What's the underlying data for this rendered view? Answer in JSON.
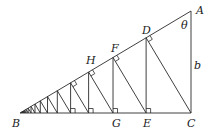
{
  "diagram": {
    "type": "geometric-construction",
    "vertices": {
      "A": [
        191,
        11
      ],
      "B": [
        20,
        113
      ],
      "C": [
        191,
        113
      ]
    },
    "labels": {
      "A": "A",
      "B": "B",
      "C": "C",
      "D": "D",
      "E": "E",
      "F": "F",
      "G": "G",
      "H": "H",
      "theta": "θ",
      "b": "b"
    },
    "label_positions": {
      "A": [
        196,
        14
      ],
      "B": [
        12,
        127
      ],
      "C": [
        187,
        127
      ],
      "D": [
        142,
        34
      ],
      "E": [
        143,
        127
      ],
      "F": [
        111,
        52
      ],
      "G": [
        112,
        127
      ],
      "H": [
        86,
        64
      ],
      "theta": [
        181,
        29
      ],
      "b": [
        194,
        69
      ]
    },
    "zigzag_steps": 16,
    "right_angle_markers_base": 4,
    "right_angle_markers_hyp": 4,
    "line_color": "#2a2a2a"
  }
}
